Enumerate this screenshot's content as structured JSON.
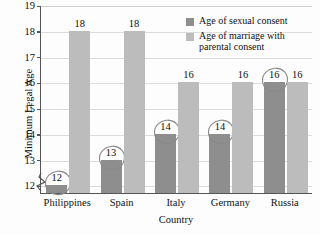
{
  "chart_data": {
    "type": "bar",
    "title": "",
    "xlabel": "Country",
    "ylabel": "Minimum Legal Age",
    "categories": [
      "Philippines",
      "Spain",
      "Italy",
      "Germany",
      "Russia"
    ],
    "series": [
      {
        "name": "Age of sexual consent",
        "color": "#8e8e8e",
        "values": [
          12,
          13,
          14,
          14,
          16
        ]
      },
      {
        "name": "Age of marriage with parental consent",
        "color": "#bcbcbc",
        "values": [
          18,
          18,
          16,
          16,
          16
        ]
      }
    ],
    "ylim": [
      11.7,
      19
    ],
    "yticks": [
      12,
      13,
      14,
      15,
      16,
      17,
      18,
      19
    ],
    "ytick_labels": [
      "12",
      "13",
      "14",
      "15",
      "16",
      "17",
      "18",
      "19"
    ],
    "grid": true,
    "axis_break": true,
    "legend_position": "top-right",
    "annotations": [
      {
        "label": "12",
        "shape": "hand-drawn-circle",
        "series": "Age of sexual consent",
        "category": "Philippines"
      },
      {
        "label": "13",
        "shape": "hand-drawn-circle",
        "series": "Age of sexual consent",
        "category": "Spain"
      },
      {
        "label": "14",
        "shape": "hand-drawn-circle",
        "series": "Age of sexual consent",
        "category": "Italy"
      },
      {
        "label": "14",
        "shape": "hand-drawn-circle",
        "series": "Age of sexual consent",
        "category": "Germany"
      },
      {
        "label": "16",
        "shape": "hand-drawn-circle",
        "series": "Age of sexual consent",
        "category": "Russia"
      }
    ],
    "data_labels": {
      "Philippines": {
        "dark": "12",
        "light": "18"
      },
      "Spain": {
        "dark": "13",
        "light": "18"
      },
      "Italy": {
        "dark": "14",
        "light": "16"
      },
      "Germany": {
        "dark": "14",
        "light": "16"
      },
      "Russia": {
        "dark": "16",
        "light": "16"
      }
    }
  },
  "axes": {
    "y_title": "Minimum Legal Age",
    "x_title": "Country",
    "y_tick_labels": [
      "19",
      "18",
      "17",
      "16",
      "15",
      "14",
      "13",
      "12"
    ],
    "x_tick_labels": [
      "Philippines",
      "Spain",
      "Italy",
      "Germany",
      "Russia"
    ]
  },
  "legend": {
    "items": [
      {
        "label": "Age of sexual consent",
        "swatch": "dark-gray"
      },
      {
        "label": "Age of marriage with parental consent",
        "swatch": "light-gray"
      }
    ]
  },
  "values": {
    "philippines_dark": "12",
    "philippines_light": "18",
    "spain_dark": "13",
    "spain_light": "18",
    "italy_dark": "14",
    "italy_light": "16",
    "germany_dark": "14",
    "germany_light": "16",
    "russia_dark": "16",
    "russia_light": "16"
  }
}
